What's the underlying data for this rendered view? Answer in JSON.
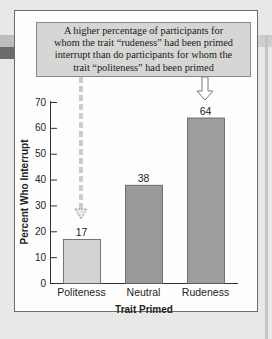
{
  "annotation": {
    "lines": [
      "A higher percentage of participants for",
      "whom the trait “rudeness” had been primed",
      "interrupt than do participants for whom the",
      "trait “politeness” had been primed"
    ]
  },
  "colors": {
    "callout_fill": "#d6d6d4",
    "bar_politeness": "#d3d3d3",
    "bar_neutral": "#9a9a9a",
    "bar_rudeness": "#9e9e9e",
    "page_background": "#e8e8e6"
  },
  "chart_data": {
    "type": "bar",
    "title": "",
    "categories": [
      "Politeness",
      "Neutral",
      "Rudeness"
    ],
    "values": [
      17,
      38,
      64
    ],
    "data_labels": [
      "17",
      "38",
      "64"
    ],
    "xlabel": "Trait Primed",
    "ylabel": "Percent Who Interrupt",
    "ylim": [
      0,
      70
    ],
    "yticks": [
      0,
      10,
      20,
      30,
      40,
      50,
      60,
      70
    ],
    "grid": false,
    "legend": null,
    "annotations": [
      {
        "text": "A higher percentage of participants for whom the trait “rudeness” had been primed interrupt than do participants for whom the trait “politeness” had been primed",
        "arrows_to": [
          "Politeness (dashed)",
          "Rudeness (solid)"
        ]
      }
    ]
  }
}
